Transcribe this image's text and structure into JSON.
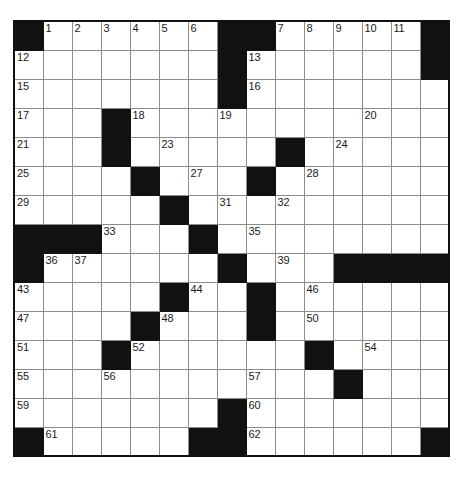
{
  "puzzle": {
    "type": "crossword-grid",
    "rows": 15,
    "cols": 15,
    "cell_size_px": 29,
    "colors": {
      "block": "#111111",
      "cell": "#ffffff",
      "gridline": "#8c8c8c",
      "border": "#111111",
      "number_text": "#1a1a1a"
    },
    "legend": {
      "block_char": "#",
      "open_char": "."
    },
    "grid": [
      "#......##.....#",
      ".......#......#",
      ".......#.......",
      "...#...........",
      "...#.....#.....",
      "....#...#......",
      ".....#.........",
      "###...#........",
      "#......#...####",
      ".....#..#......",
      "....#...#......",
      "...#......#....",
      "...........#...",
      ".......#.......",
      "#.....##......#"
    ],
    "numbers": [
      {
        "n": 1,
        "row": 0,
        "col": 1
      },
      {
        "n": 2,
        "row": 0,
        "col": 2
      },
      {
        "n": 3,
        "row": 0,
        "col": 3
      },
      {
        "n": 4,
        "row": 0,
        "col": 4
      },
      {
        "n": 5,
        "row": 0,
        "col": 5
      },
      {
        "n": 6,
        "row": 0,
        "col": 6
      },
      {
        "n": 7,
        "row": 0,
        "col": 9
      },
      {
        "n": 8,
        "row": 0,
        "col": 10
      },
      {
        "n": 9,
        "row": 0,
        "col": 11
      },
      {
        "n": 10,
        "row": 0,
        "col": 12
      },
      {
        "n": 11,
        "row": 0,
        "col": 13
      },
      {
        "n": 12,
        "row": 1,
        "col": 0
      },
      {
        "n": 13,
        "row": 1,
        "col": 8
      },
      {
        "n": 14,
        "row": 1,
        "col": 14
      },
      {
        "n": 15,
        "row": 2,
        "col": 0
      },
      {
        "n": 16,
        "row": 2,
        "col": 8
      },
      {
        "n": 17,
        "row": 3,
        "col": 0
      },
      {
        "n": 18,
        "row": 3,
        "col": 4
      },
      {
        "n": 19,
        "row": 3,
        "col": 7
      },
      {
        "n": 20,
        "row": 3,
        "col": 12
      },
      {
        "n": 21,
        "row": 4,
        "col": 0
      },
      {
        "n": 22,
        "row": 4,
        "col": 3
      },
      {
        "n": 23,
        "row": 4,
        "col": 5
      },
      {
        "n": 24,
        "row": 4,
        "col": 11
      },
      {
        "n": 25,
        "row": 5,
        "col": 0
      },
      {
        "n": 26,
        "row": 5,
        "col": 4
      },
      {
        "n": 27,
        "row": 5,
        "col": 6
      },
      {
        "n": 28,
        "row": 5,
        "col": 10
      },
      {
        "n": 29,
        "row": 6,
        "col": 0
      },
      {
        "n": 30,
        "row": 6,
        "col": 5
      },
      {
        "n": 31,
        "row": 6,
        "col": 7
      },
      {
        "n": 32,
        "row": 6,
        "col": 9
      },
      {
        "n": 33,
        "row": 7,
        "col": 3
      },
      {
        "n": 34,
        "row": 7,
        "col": 6
      },
      {
        "n": 35,
        "row": 7,
        "col": 8
      },
      {
        "n": 36,
        "row": 8,
        "col": 1
      },
      {
        "n": 37,
        "row": 8,
        "col": 2
      },
      {
        "n": 38,
        "row": 8,
        "col": 7
      },
      {
        "n": 39,
        "row": 8,
        "col": 9
      },
      {
        "n": 40,
        "row": 8,
        "col": 12
      },
      {
        "n": 41,
        "row": 8,
        "col": 13
      },
      {
        "n": 42,
        "row": 8,
        "col": 14
      },
      {
        "n": 43,
        "row": 9,
        "col": 0
      },
      {
        "n": 44,
        "row": 9,
        "col": 6
      },
      {
        "n": 45,
        "row": 9,
        "col": 8
      },
      {
        "n": 46,
        "row": 9,
        "col": 10
      },
      {
        "n": 47,
        "row": 10,
        "col": 0
      },
      {
        "n": 48,
        "row": 10,
        "col": 5
      },
      {
        "n": 49,
        "row": 10,
        "col": 8
      },
      {
        "n": 50,
        "row": 10,
        "col": 10
      },
      {
        "n": 51,
        "row": 11,
        "col": 0
      },
      {
        "n": 52,
        "row": 11,
        "col": 4
      },
      {
        "n": 53,
        "row": 11,
        "col": 10
      },
      {
        "n": 54,
        "row": 11,
        "col": 12
      },
      {
        "n": 55,
        "row": 12,
        "col": 0
      },
      {
        "n": 56,
        "row": 12,
        "col": 3
      },
      {
        "n": 57,
        "row": 12,
        "col": 8
      },
      {
        "n": 58,
        "row": 12,
        "col": 11
      },
      {
        "n": 59,
        "row": 13,
        "col": 0
      },
      {
        "n": 60,
        "row": 13,
        "col": 8
      },
      {
        "n": 61,
        "row": 14,
        "col": 1
      },
      {
        "n": 62,
        "row": 14,
        "col": 8
      }
    ]
  }
}
